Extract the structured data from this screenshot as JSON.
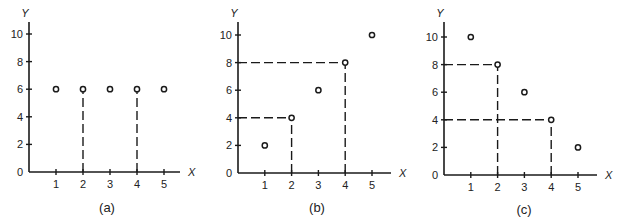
{
  "chart_data": [
    {
      "type": "scatter",
      "panel": "(a)",
      "xlabel": "X",
      "ylabel": "Y",
      "x_ticks": [
        1,
        2,
        3,
        4,
        5
      ],
      "y_ticks": [
        0,
        2,
        4,
        6,
        8,
        10
      ],
      "xlim": [
        0,
        5.5
      ],
      "ylim": [
        0,
        11
      ],
      "grid": false,
      "points": [
        {
          "x": 1,
          "y": 6
        },
        {
          "x": 2,
          "y": 6
        },
        {
          "x": 3,
          "y": 6
        },
        {
          "x": 4,
          "y": 6
        },
        {
          "x": 5,
          "y": 6
        }
      ],
      "dashed_guides": [
        {
          "vertical_from": {
            "x": 2,
            "y": 0
          },
          "to": {
            "x": 2,
            "y": 6
          }
        },
        {
          "vertical_from": {
            "x": 4,
            "y": 0
          },
          "to": {
            "x": 4,
            "y": 6
          }
        }
      ]
    },
    {
      "type": "scatter",
      "panel": "(b)",
      "xlabel": "X",
      "ylabel": "Y",
      "x_ticks": [
        1,
        2,
        3,
        4,
        5
      ],
      "y_ticks": [
        0,
        2,
        4,
        6,
        8,
        10
      ],
      "xlim": [
        0,
        5.5
      ],
      "ylim": [
        0,
        11
      ],
      "grid": false,
      "points": [
        {
          "x": 1,
          "y": 2
        },
        {
          "x": 2,
          "y": 4
        },
        {
          "x": 3,
          "y": 6
        },
        {
          "x": 4,
          "y": 8
        },
        {
          "x": 5,
          "y": 10
        }
      ],
      "dashed_guides": [
        {
          "vertical_from": {
            "x": 2,
            "y": 0
          },
          "to": {
            "x": 2,
            "y": 4
          }
        },
        {
          "horizontal_from": {
            "x": 0,
            "y": 4
          },
          "to": {
            "x": 2,
            "y": 4
          }
        },
        {
          "vertical_from": {
            "x": 4,
            "y": 0
          },
          "to": {
            "x": 4,
            "y": 8
          }
        },
        {
          "horizontal_from": {
            "x": 0,
            "y": 8
          },
          "to": {
            "x": 4,
            "y": 8
          }
        }
      ]
    },
    {
      "type": "scatter",
      "panel": "(c)",
      "xlabel": "X",
      "ylabel": "Y",
      "x_ticks": [
        1,
        2,
        3,
        4,
        5
      ],
      "y_ticks": [
        0,
        2,
        4,
        6,
        8,
        10
      ],
      "xlim": [
        0,
        5.5
      ],
      "ylim": [
        0,
        11
      ],
      "grid": false,
      "points": [
        {
          "x": 1,
          "y": 10
        },
        {
          "x": 2,
          "y": 8
        },
        {
          "x": 3,
          "y": 6
        },
        {
          "x": 4,
          "y": 4
        },
        {
          "x": 5,
          "y": 2
        }
      ],
      "dashed_guides": [
        {
          "vertical_from": {
            "x": 2,
            "y": 0
          },
          "to": {
            "x": 2,
            "y": 8
          }
        },
        {
          "horizontal_from": {
            "x": 0,
            "y": 8
          },
          "to": {
            "x": 2,
            "y": 8
          }
        },
        {
          "vertical_from": {
            "x": 4,
            "y": 0
          },
          "to": {
            "x": 4,
            "y": 4
          }
        },
        {
          "horizontal_from": {
            "x": 0,
            "y": 4
          },
          "to": {
            "x": 4,
            "y": 4
          }
        }
      ]
    }
  ],
  "panels": [
    {
      "caption": "(a)",
      "x_axis_label": "X",
      "y_axis_label": "Y",
      "y_tick_labels": [
        "0",
        "2",
        "4",
        "6",
        "8",
        "10"
      ],
      "x_tick_labels": [
        "1",
        "2",
        "3",
        "4",
        "5"
      ]
    },
    {
      "caption": "(b)",
      "x_axis_label": "X",
      "y_axis_label": "Y",
      "y_tick_labels": [
        "0",
        "2",
        "4",
        "6",
        "8",
        "10"
      ],
      "x_tick_labels": [
        "1",
        "2",
        "3",
        "4",
        "5"
      ]
    },
    {
      "caption": "(c)",
      "x_axis_label": "X",
      "y_axis_label": "Y",
      "y_tick_labels": [
        "0",
        "2",
        "4",
        "6",
        "8",
        "10"
      ],
      "x_tick_labels": [
        "1",
        "2",
        "3",
        "4",
        "5"
      ]
    }
  ]
}
